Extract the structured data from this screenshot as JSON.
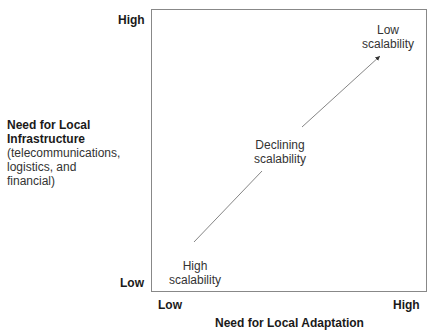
{
  "y_axis": {
    "title": "Need for Local Infrastructure",
    "subtitle": "(telecommunications, logistics, and financial)",
    "subtitle_lines": [
      "(telecommunications,",
      "logistics, and",
      "financial)"
    ],
    "high_label": "High",
    "low_label": "Low"
  },
  "x_axis": {
    "title": "Need for Local Adaptation",
    "low_label": "Low",
    "high_label": "High"
  },
  "points": [
    {
      "line1": "High",
      "line2": "scalability"
    },
    {
      "line1": "Declining",
      "line2": "scalability"
    },
    {
      "line1": "Low",
      "line2": "scalability"
    }
  ],
  "colors": {
    "border": "#888888",
    "arrow": "#555555",
    "text": "#1a1a1a"
  }
}
